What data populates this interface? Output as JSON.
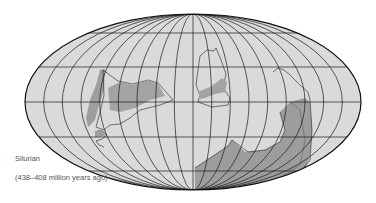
{
  "map": {
    "projection": "mollweide",
    "period": "Silurian",
    "date_range": "(438–408 million years ago)",
    "colors": {
      "ocean": "#d9d9d9",
      "land_shallow": "#d9d9d9",
      "land_exposed": "#9b9b9b",
      "grid": "#1a1a1a",
      "outline": "#111111"
    },
    "graticule": {
      "meridians": 18,
      "parallels_deg": [
        -60,
        -30,
        0,
        30,
        60
      ]
    },
    "landmasses": [
      "Laurentia",
      "Baltica",
      "Siberia",
      "Gondwana"
    ]
  }
}
